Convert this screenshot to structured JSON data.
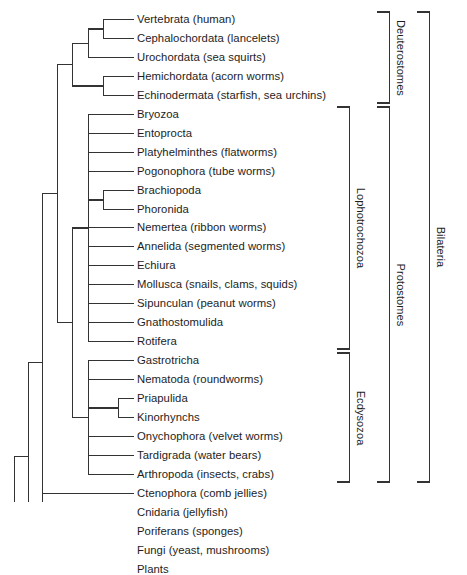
{
  "figure": {
    "type": "phylogenetic-cladogram",
    "orientation": "horizontal-left-root",
    "line_color": "#333333",
    "background_color": "#ffffff"
  },
  "leaves": [
    {
      "id": "vertebrata",
      "label": "Vertebrata (human)"
    },
    {
      "id": "cephalochordata",
      "label": "Cephalochordata (lancelets)"
    },
    {
      "id": "urochordata",
      "label": "Urochordata (sea squirts)"
    },
    {
      "id": "hemichordata",
      "label": "Hemichordata (acorn worms)"
    },
    {
      "id": "echinodermata",
      "label": "Echinodermata (starfish, sea urchins)"
    },
    {
      "id": "bryozoa",
      "label": "Bryozoa"
    },
    {
      "id": "entoprocta",
      "label": "Entoprocta"
    },
    {
      "id": "platyhelminthes",
      "label": "Platyhelminthes (flatworms)"
    },
    {
      "id": "pogonophora",
      "label": "Pogonophora (tube worms)"
    },
    {
      "id": "brachiopoda",
      "label": "Brachiopoda"
    },
    {
      "id": "phoronida",
      "label": "Phoronida"
    },
    {
      "id": "nemertea",
      "label": "Nemertea (ribbon worms)"
    },
    {
      "id": "annelida",
      "label": "Annelida (segmented worms)"
    },
    {
      "id": "echiura",
      "label": "Echiura"
    },
    {
      "id": "mollusca",
      "label": "Mollusca (snails, clams, squids)"
    },
    {
      "id": "sipunculan",
      "label": "Sipunculan (peanut worms)"
    },
    {
      "id": "gnathostomulida",
      "label": "Gnathostomulida"
    },
    {
      "id": "rotifera",
      "label": "Rotifera"
    },
    {
      "id": "gastrotricha",
      "label": "Gastrotricha"
    },
    {
      "id": "nematoda",
      "label": "Nematoda (roundworms)"
    },
    {
      "id": "priapulida",
      "label": "Priapulida"
    },
    {
      "id": "kinorhynchs",
      "label": "Kinorhynchs"
    },
    {
      "id": "onychophora",
      "label": "Onychophora (velvet worms)"
    },
    {
      "id": "tardigrada",
      "label": "Tardigrada (water bears)"
    },
    {
      "id": "arthropoda",
      "label": "Arthropoda (insects, crabs)"
    },
    {
      "id": "ctenophora",
      "label": "Ctenophora (comb jellies)"
    },
    {
      "id": "cnidaria",
      "label": "Cnidaria (jellyfish)"
    },
    {
      "id": "poriferans",
      "label": "Poriferans (sponges)"
    },
    {
      "id": "fungi",
      "label": "Fungi (yeast, mushrooms)"
    },
    {
      "id": "plants",
      "label": "Plants"
    }
  ],
  "clade_brackets": [
    {
      "id": "deuterostomes",
      "label": "Deuterostomes",
      "from_leaf": "vertebrata",
      "to_leaf": "echinodermata"
    },
    {
      "id": "lophotrochozoa",
      "label": "Lophotrochozoa",
      "from_leaf": "bryozoa",
      "to_leaf": "rotifera"
    },
    {
      "id": "ecdysozoa",
      "label": "Ecdysozoa",
      "from_leaf": "gastrotricha",
      "to_leaf": "arthropoda"
    },
    {
      "id": "protostomes",
      "label": "Protostomes",
      "from_leaf": "bryozoa",
      "to_leaf": "arthropoda"
    },
    {
      "id": "bilateria",
      "label": "Bilateria",
      "from_leaf": "vertebrata",
      "to_leaf": "arthropoda"
    }
  ]
}
